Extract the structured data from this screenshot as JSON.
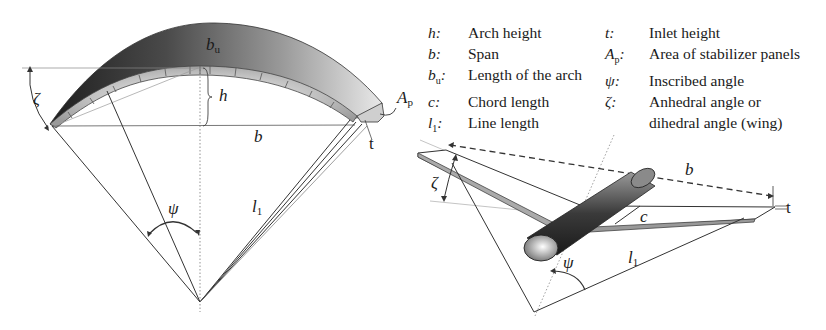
{
  "left_figure": {
    "title": "Parafoil front view (arched canopy)",
    "labels": {
      "b_u": "b",
      "b_u_sub": "u",
      "h": "h",
      "b": "b",
      "A_p": "A",
      "A_p_sub": "p",
      "t": "t",
      "zeta": "ζ",
      "psi": "ψ",
      "l_1": "l",
      "l_1_sub": "1"
    }
  },
  "right_figure": {
    "title": "Wing perspective view",
    "labels": {
      "b": "b",
      "t": "t",
      "c": "c",
      "zeta": "ζ",
      "psi": "ψ",
      "l_1": "l",
      "l_1_sub": "1"
    }
  },
  "legend": {
    "left": [
      {
        "symbol": "h",
        "sub": "",
        "desc": "Arch height"
      },
      {
        "symbol": "b",
        "sub": "",
        "desc": "Span"
      },
      {
        "symbol": "b",
        "sub": "u",
        "desc": "Length of the arch"
      },
      {
        "symbol": "c",
        "sub": "",
        "desc": "Chord length"
      },
      {
        "symbol": "l",
        "sub": "1",
        "desc": "Line length"
      }
    ],
    "right": [
      {
        "symbol": "t",
        "sub": "",
        "desc": "Inlet height"
      },
      {
        "symbol": "A",
        "sub": "p",
        "desc": "Area of stabilizer panels"
      },
      {
        "symbol": "ψ",
        "sub": "",
        "desc": "Inscribed angle"
      },
      {
        "symbol": "ζ",
        "sub": "",
        "desc": "Anhedral angle or"
      },
      {
        "symbol": "",
        "sub": "",
        "desc": "dihedral angle (wing)"
      }
    ]
  },
  "colors": {
    "line": "#333333",
    "canopy_dark": "#2e2e2e",
    "canopy_light": "#e6e6e6",
    "cell": "#d9d9d9"
  }
}
